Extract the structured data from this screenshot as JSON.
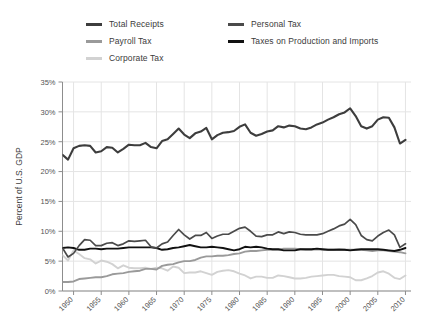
{
  "legend": {
    "items": [
      {
        "label": "Total Receipts",
        "color": "#3d3d3d",
        "col": "a",
        "row": 0
      },
      {
        "label": "Payroll Tax",
        "color": "#9a9a9a",
        "col": "a",
        "row": 1
      },
      {
        "label": "Corporate Tax",
        "color": "#d2d2d2",
        "col": "a",
        "row": 2
      },
      {
        "label": "Personal Tax",
        "color": "#4a4a4a",
        "col": "b",
        "row": 0
      },
      {
        "label": "Taxes on Production and Imports",
        "color": "#111111",
        "col": "b",
        "row": 1
      }
    ]
  },
  "chart_data": {
    "type": "line",
    "title": "",
    "xlabel": "",
    "ylabel": "Percent of U.S. GDP",
    "xlim": [
      1948,
      2011
    ],
    "ylim": [
      0,
      35
    ],
    "ytick_labels": [
      "0%",
      "5%",
      "10%",
      "15%",
      "20%",
      "25%",
      "30%",
      "35%"
    ],
    "ytick_values": [
      0,
      5,
      10,
      15,
      20,
      25,
      30,
      35
    ],
    "xtick_labels": [
      "1950",
      "1955",
      "1960",
      "1965",
      "1970",
      "1975",
      "1980",
      "1985",
      "1990",
      "1995",
      "2000",
      "2005",
      "2010"
    ],
    "xtick_values": [
      1950,
      1955,
      1960,
      1965,
      1970,
      1975,
      1980,
      1985,
      1990,
      1995,
      2000,
      2005,
      2010
    ],
    "grid": true,
    "legend_position": "top",
    "x": [
      1948,
      1949,
      1950,
      1951,
      1952,
      1953,
      1954,
      1955,
      1956,
      1957,
      1958,
      1959,
      1960,
      1961,
      1962,
      1963,
      1964,
      1965,
      1966,
      1967,
      1968,
      1969,
      1970,
      1971,
      1972,
      1973,
      1974,
      1975,
      1976,
      1977,
      1978,
      1979,
      1980,
      1981,
      1982,
      1983,
      1984,
      1985,
      1986,
      1987,
      1988,
      1989,
      1990,
      1991,
      1992,
      1993,
      1994,
      1995,
      1996,
      1997,
      1998,
      1999,
      2000,
      2001,
      2002,
      2003,
      2004,
      2005,
      2006,
      2007,
      2008,
      2009,
      2010
    ],
    "series": [
      {
        "name": "Total Receipts",
        "color": "#3d3d3d",
        "width": 2.1,
        "values": [
          22.8,
          22.0,
          23.9,
          24.3,
          24.4,
          24.3,
          23.2,
          23.4,
          24.1,
          24.0,
          23.2,
          23.8,
          24.5,
          24.4,
          24.4,
          24.8,
          24.1,
          23.9,
          25.1,
          25.4,
          26.3,
          27.2,
          26.2,
          25.6,
          26.4,
          26.7,
          27.3,
          25.4,
          26.1,
          26.5,
          26.6,
          26.8,
          27.5,
          27.9,
          26.5,
          26.0,
          26.3,
          26.7,
          26.9,
          27.6,
          27.4,
          27.7,
          27.6,
          27.2,
          27.1,
          27.4,
          27.9,
          28.2,
          28.7,
          29.1,
          29.6,
          29.9,
          30.6,
          29.3,
          27.6,
          27.2,
          27.6,
          28.7,
          29.1,
          29.0,
          27.4,
          24.7,
          25.3
        ]
      },
      {
        "name": "Personal Tax",
        "color": "#4a4a4a",
        "width": 1.7,
        "values": [
          7.2,
          5.7,
          6.3,
          7.6,
          8.6,
          8.5,
          7.6,
          7.6,
          8.0,
          8.1,
          7.6,
          7.9,
          8.4,
          8.3,
          8.4,
          8.5,
          7.4,
          7.2,
          7.9,
          8.2,
          9.3,
          10.3,
          9.4,
          8.7,
          9.3,
          9.3,
          9.8,
          8.8,
          9.2,
          9.5,
          9.5,
          10.0,
          10.5,
          10.7,
          10.0,
          9.2,
          9.1,
          9.4,
          9.4,
          9.9,
          9.6,
          9.9,
          9.8,
          9.5,
          9.4,
          9.4,
          9.4,
          9.6,
          10.0,
          10.4,
          10.9,
          11.2,
          12.0,
          11.1,
          9.3,
          8.6,
          8.4,
          9.2,
          9.8,
          10.2,
          9.4,
          7.3,
          7.9
        ]
      },
      {
        "name": "Taxes on Production and Imports",
        "color": "#111111",
        "width": 1.9,
        "values": [
          7.2,
          7.3,
          7.2,
          6.9,
          6.9,
          7.1,
          7.1,
          7.0,
          7.1,
          7.1,
          7.1,
          7.2,
          7.3,
          7.3,
          7.3,
          7.3,
          7.3,
          7.2,
          6.9,
          7.0,
          7.2,
          7.3,
          7.5,
          7.7,
          7.5,
          7.3,
          7.3,
          7.4,
          7.3,
          7.2,
          7.0,
          6.8,
          7.0,
          7.4,
          7.3,
          7.4,
          7.3,
          7.1,
          7.0,
          7.0,
          6.8,
          6.8,
          6.8,
          7.0,
          7.0,
          7.0,
          7.1,
          7.0,
          6.9,
          6.9,
          6.9,
          6.9,
          6.8,
          6.9,
          7.0,
          7.0,
          7.0,
          7.0,
          6.9,
          6.8,
          6.7,
          6.9,
          7.2
        ]
      },
      {
        "name": "Payroll Tax",
        "color": "#9a9a9a",
        "width": 1.9,
        "values": [
          1.5,
          1.5,
          1.6,
          2.0,
          2.1,
          2.2,
          2.3,
          2.3,
          2.5,
          2.8,
          2.9,
          3.0,
          3.2,
          3.3,
          3.4,
          3.7,
          3.7,
          3.6,
          4.2,
          4.4,
          4.5,
          4.8,
          5.0,
          5.0,
          5.2,
          5.6,
          5.8,
          5.8,
          5.9,
          5.9,
          6.0,
          6.2,
          6.3,
          6.6,
          6.7,
          6.7,
          6.8,
          6.9,
          6.9,
          6.9,
          7.1,
          7.1,
          7.1,
          7.0,
          6.9,
          6.9,
          7.0,
          6.9,
          6.9,
          6.9,
          7.0,
          6.9,
          6.9,
          6.9,
          6.9,
          6.8,
          6.7,
          6.8,
          6.8,
          6.7,
          6.6,
          6.5,
          6.3
        ]
      },
      {
        "name": "Corporate Tax",
        "color": "#d2d2d2",
        "width": 1.9,
        "values": [
          6.0,
          5.1,
          6.8,
          6.2,
          5.5,
          5.3,
          4.6,
          5.1,
          4.9,
          4.5,
          3.8,
          4.3,
          3.9,
          3.8,
          3.8,
          3.9,
          3.7,
          3.9,
          3.8,
          3.4,
          4.1,
          3.9,
          3.0,
          3.1,
          3.1,
          3.3,
          3.0,
          2.7,
          3.2,
          3.4,
          3.5,
          3.3,
          2.9,
          2.6,
          2.1,
          2.4,
          2.4,
          2.2,
          2.2,
          2.6,
          2.5,
          2.3,
          2.1,
          2.1,
          2.2,
          2.4,
          2.5,
          2.6,
          2.7,
          2.7,
          2.5,
          2.4,
          2.3,
          1.8,
          1.8,
          2.1,
          2.5,
          3.1,
          3.3,
          2.9,
          2.2,
          2.0,
          2.6
        ]
      }
    ]
  }
}
